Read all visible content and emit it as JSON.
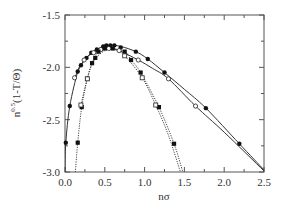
{
  "chart_data": {
    "type": "line",
    "title": "",
    "xlabel": "nσ",
    "ylabel": "n^{0.5}(1-T/Θ)",
    "ylabel_base": "n",
    "ylabel_sup": "0.5",
    "ylabel_rest": "(1-T/Θ)",
    "xlim": [
      0.0,
      2.5
    ],
    "ylim": [
      -3.0,
      -1.5
    ],
    "x_ticks": [
      "0.0",
      "0.5",
      "1.0",
      "1.5",
      "2.0",
      "2.5"
    ],
    "x_tick_values": [
      0.0,
      0.5,
      1.0,
      1.5,
      2.0,
      2.5
    ],
    "x_minor_step": 0.25,
    "y_ticks": [
      "-1.5",
      "-2.0",
      "-2.5",
      "-3.0"
    ],
    "y_tick_values": [
      -1.5,
      -2.0,
      -2.5,
      -3.0
    ],
    "grid": false,
    "legend": null,
    "series": [
      {
        "name": "filled circles (outer, solid)",
        "marker": "filled-circle",
        "line": "solid",
        "x": [
          0.01,
          0.06,
          0.16,
          0.2,
          0.27,
          0.33,
          0.4,
          0.48,
          0.52,
          0.57,
          0.62,
          0.7,
          0.89,
          1.04,
          1.25,
          1.77,
          2.19
        ],
        "y": [
          -2.72,
          -2.37,
          -2.04,
          -1.98,
          -1.91,
          -1.86,
          -1.83,
          -1.8,
          -1.79,
          -1.79,
          -1.79,
          -1.81,
          -1.85,
          -1.92,
          -2.05,
          -2.39,
          -2.73
        ],
        "curve": [
          [
            0.0,
            -3.0
          ],
          [
            0.01,
            -2.72
          ],
          [
            0.06,
            -2.37
          ],
          [
            0.16,
            -2.04
          ],
          [
            0.2,
            -1.98
          ],
          [
            0.27,
            -1.91
          ],
          [
            0.33,
            -1.86
          ],
          [
            0.4,
            -1.83
          ],
          [
            0.48,
            -1.8
          ],
          [
            0.57,
            -1.79
          ],
          [
            0.7,
            -1.8
          ],
          [
            0.89,
            -1.85
          ],
          [
            1.04,
            -1.92
          ],
          [
            1.25,
            -2.05
          ],
          [
            1.5,
            -2.21
          ],
          [
            1.77,
            -2.39
          ],
          [
            2.19,
            -2.73
          ],
          [
            2.5,
            -2.98
          ]
        ]
      },
      {
        "name": "open circles (solid)",
        "marker": "open-circle",
        "line": "solid",
        "x": [
          0.12,
          0.24,
          0.36,
          0.45,
          0.55,
          0.68,
          0.92,
          1.3,
          1.64
        ],
        "y": [
          -2.1,
          -1.93,
          -1.86,
          -1.83,
          -1.82,
          -1.84,
          -1.93,
          -2.11,
          -2.37
        ],
        "curve": [
          [
            0.12,
            -2.1
          ],
          [
            0.24,
            -1.93
          ],
          [
            0.36,
            -1.86
          ],
          [
            0.45,
            -1.83
          ],
          [
            0.55,
            -1.82
          ],
          [
            0.68,
            -1.84
          ],
          [
            0.92,
            -1.93
          ],
          [
            1.1,
            -2.01
          ],
          [
            1.3,
            -2.11
          ],
          [
            1.64,
            -2.37
          ],
          [
            2.0,
            -2.62
          ],
          [
            2.5,
            -2.99
          ]
        ]
      },
      {
        "name": "filled squares (inner, dotted)",
        "marker": "filled-square",
        "line": "dotted",
        "x": [
          0.16,
          0.21,
          0.28,
          0.34,
          0.38,
          0.42,
          0.5,
          0.6,
          0.75,
          0.83,
          0.95,
          1.18,
          1.37
        ],
        "y": [
          -2.72,
          -2.38,
          -2.11,
          -1.96,
          -1.91,
          -1.85,
          -1.82,
          -1.82,
          -1.85,
          -1.93,
          -2.05,
          -2.38,
          -2.73
        ],
        "curve": [
          [
            0.13,
            -3.0
          ],
          [
            0.16,
            -2.72
          ],
          [
            0.21,
            -2.38
          ],
          [
            0.28,
            -2.11
          ],
          [
            0.34,
            -1.96
          ],
          [
            0.42,
            -1.85
          ],
          [
            0.5,
            -1.82
          ],
          [
            0.6,
            -1.82
          ],
          [
            0.75,
            -1.85
          ],
          [
            0.83,
            -1.93
          ],
          [
            0.95,
            -2.05
          ],
          [
            1.18,
            -2.38
          ],
          [
            1.37,
            -2.73
          ],
          [
            1.48,
            -3.0
          ]
        ]
      },
      {
        "name": "open squares (dotted)",
        "marker": "open-square",
        "line": "dotted",
        "x": [
          0.2,
          0.28,
          0.75,
          0.97,
          1.14
        ],
        "y": [
          -2.36,
          -2.11,
          -1.89,
          -2.1,
          -2.36
        ],
        "curve": [
          [
            0.2,
            -2.36
          ],
          [
            0.28,
            -2.11
          ],
          [
            0.36,
            -1.94
          ],
          [
            0.5,
            -1.84
          ],
          [
            0.62,
            -1.83
          ],
          [
            0.75,
            -1.89
          ],
          [
            0.97,
            -2.1
          ],
          [
            1.14,
            -2.36
          ],
          [
            1.3,
            -2.65
          ],
          [
            1.45,
            -3.0
          ]
        ]
      }
    ]
  },
  "colors": {
    "axis": "#555555",
    "line": "#333333",
    "marker": "#111111",
    "background": "#ffffff"
  }
}
